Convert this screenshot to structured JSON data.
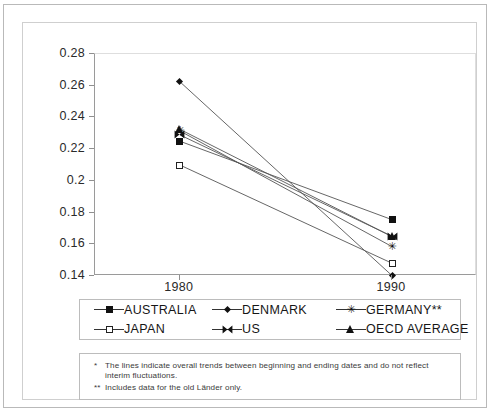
{
  "figure": {
    "title_sliver": "",
    "background_color": "#ffffff",
    "frame_color": "#b9b9b9",
    "line_color": "#555555"
  },
  "chart_data": {
    "type": "line",
    "title": "",
    "subtitle": "",
    "xlabel": "",
    "ylabel": "",
    "categories": [
      "1980",
      "1990"
    ],
    "x": [
      1980,
      1990
    ],
    "xlim": [
      1976,
      1994
    ],
    "ylim": [
      0.14,
      0.28
    ],
    "yticks": [
      0.14,
      0.16,
      0.18,
      0.2,
      0.22,
      0.24,
      0.26,
      0.28
    ],
    "ytick_labels": [
      "0.14",
      "0.16",
      "0.18",
      "0.2",
      "0.22",
      "0.24",
      "0.26",
      "0.28"
    ],
    "xtick_labels": [
      "1980",
      "1990"
    ],
    "grid": false,
    "legend_position": "below-plot",
    "series": [
      {
        "name": "AUSTRALIA",
        "marker": "square-filled",
        "values": [
          0.225,
          0.1755
        ]
      },
      {
        "name": "DENMARK",
        "marker": "diamond",
        "values": [
          0.2625,
          0.1402
        ]
      },
      {
        "name": "GERMANY**",
        "marker": "asterisk",
        "values": [
          0.2315,
          0.1585
        ]
      },
      {
        "name": "JAPAN",
        "marker": "square-open",
        "values": [
          0.21,
          0.148
        ]
      },
      {
        "name": "US",
        "marker": "bowtie",
        "values": [
          0.229,
          0.165
        ]
      },
      {
        "name": "OECD AVERAGE",
        "marker": "triangle",
        "values": [
          0.2325,
          0.1648
        ]
      }
    ]
  },
  "legend": {
    "entries": [
      {
        "label": "AUSTRALIA",
        "marker": "square-filled"
      },
      {
        "label": "DENMARK",
        "marker": "diamond"
      },
      {
        "label": "GERMANY**",
        "marker": "asterisk"
      },
      {
        "label": "JAPAN",
        "marker": "square-open"
      },
      {
        "label": "US",
        "marker": "bowtie"
      },
      {
        "label": "OECD AVERAGE",
        "marker": "triangle"
      }
    ]
  },
  "footnotes": [
    {
      "marker": "*",
      "text": "The lines indicate overall trends between beginning and ending dates and do not reflect interim fluctuations."
    },
    {
      "marker": "**",
      "text": "Includes data for the old Länder only."
    }
  ]
}
